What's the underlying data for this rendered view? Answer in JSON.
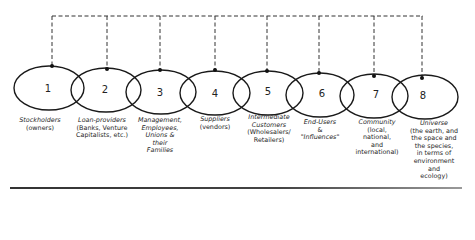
{
  "diagram": {
    "type": "stakeholder-circles",
    "connector_style": "dashed",
    "stroke_color": "#222222",
    "stakeholders": [
      {
        "number": "1",
        "title": "Stockholders",
        "desc": [
          "(owners)"
        ]
      },
      {
        "number": "2",
        "title": "Loan-providers",
        "desc": [
          "(Banks, Venture",
          "Capitalists, etc.)"
        ]
      },
      {
        "number": "3",
        "title": "Management, Employees, Unions & their Families",
        "title_lines": [
          "Management,",
          "Employees,",
          "Unions &",
          "their",
          "Families"
        ],
        "desc": []
      },
      {
        "number": "4",
        "title": "Suppliers",
        "desc": [
          "(vendors)"
        ]
      },
      {
        "number": "5",
        "title": "Intermediate Customers",
        "title_lines": [
          "Intermediate",
          "Customers"
        ],
        "desc": [
          "(Wholesalers/",
          "Retailers)"
        ]
      },
      {
        "number": "6",
        "title": "End-Users",
        "desc": [
          "&",
          "\"Influences\""
        ],
        "desc_italic": true
      },
      {
        "number": "7",
        "title": "Community",
        "desc": [
          "(local,",
          "national,",
          "and",
          "international)"
        ]
      },
      {
        "number": "8",
        "title": "Universe",
        "desc": [
          "(the earth, and",
          "the space and",
          "the species,",
          "in terms of",
          "environment",
          "and",
          "ecology)"
        ]
      }
    ]
  },
  "labels": {
    "s1": {
      "title": "Stockholders",
      "d1": "(owners)"
    },
    "s2": {
      "title": "Loan-providers",
      "d1": "(Banks, Venture",
      "d2": "Capitalists, etc.)"
    },
    "s3": {
      "t1": "Management,",
      "t2": "Employees,",
      "t3": "Unions &",
      "t4": "their",
      "t5": "Families"
    },
    "s4": {
      "title": "Suppliers",
      "d1": "(vendors)"
    },
    "s5": {
      "t1": "Intermediate",
      "t2": "Customers",
      "d1": "(Wholesalers/",
      "d2": "Retailers)"
    },
    "s6": {
      "title": "End-Users",
      "d1": "&",
      "d2": "\"Influences\""
    },
    "s7": {
      "title": "Community",
      "d1": "(local,",
      "d2": "national,",
      "d3": "and",
      "d4": "international)"
    },
    "s8": {
      "title": "Universe",
      "d1": "(the earth, and",
      "d2": "the space and",
      "d3": "the species,",
      "d4": "in terms of",
      "d5": "environment",
      "d6": "and",
      "d7": "ecology)"
    }
  },
  "numbers": [
    "1",
    "2",
    "3",
    "4",
    "5",
    "6",
    "7",
    "8"
  ]
}
